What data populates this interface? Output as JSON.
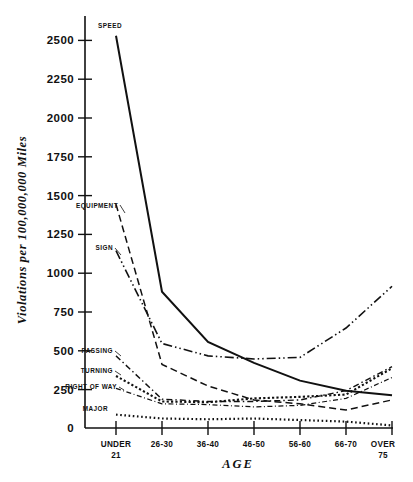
{
  "chart_data": {
    "type": "line",
    "title": "",
    "xlabel": "AGE",
    "ylabel": "Violations per 100,000,000 Miles",
    "categories": [
      "UNDER 21",
      "26-30",
      "36-40",
      "46-50",
      "56-60",
      "66-70",
      "OVER 75"
    ],
    "x_tick_labels": [
      {
        "line1": "UNDER",
        "line2": "21"
      },
      {
        "line1": "26-30",
        "line2": ""
      },
      {
        "line1": "36-40",
        "line2": ""
      },
      {
        "line1": "46-50",
        "line2": ""
      },
      {
        "line1": "56-60",
        "line2": ""
      },
      {
        "line1": "66-70",
        "line2": ""
      },
      {
        "line1": "OVER",
        "line2": "75"
      }
    ],
    "y_tick_labels": [
      "2500",
      "2250",
      "2000",
      "1750",
      "1500",
      "1250",
      "1000",
      "750",
      "500",
      "250",
      "0"
    ],
    "y_ticks": [
      2500,
      2250,
      2000,
      1750,
      1500,
      1250,
      1000,
      750,
      500,
      250,
      0
    ],
    "ylim": [
      0,
      2650
    ],
    "grid": false,
    "legend_position": "inline-left-labels",
    "series": [
      {
        "name": "SPEED",
        "style": "solid",
        "values": [
          2530,
          875,
          550,
          415,
          300,
          235,
          205
        ]
      },
      {
        "name": "EQUIPMENT",
        "style": "dashed",
        "values": [
          1440,
          405,
          265,
          175,
          150,
          110,
          175
        ]
      },
      {
        "name": "SIGN",
        "style": "dash-dot-dot",
        "values": [
          1140,
          540,
          460,
          440,
          450,
          640,
          910
        ]
      },
      {
        "name": "PASSING",
        "style": "dash-dot",
        "values": [
          460,
          180,
          165,
          165,
          175,
          235,
          390
        ]
      },
      {
        "name": "TURNING",
        "style": "dotted-thick",
        "values": [
          330,
          165,
          160,
          185,
          195,
          210,
          380
        ]
      },
      {
        "name": "RIGHT OF WAY",
        "style": "dash-dot-fine",
        "values": [
          250,
          150,
          145,
          130,
          140,
          185,
          320
        ]
      },
      {
        "name": "MAJOR",
        "style": "dotted",
        "values": [
          80,
          55,
          50,
          55,
          45,
          35,
          10
        ]
      }
    ],
    "annotations": []
  }
}
